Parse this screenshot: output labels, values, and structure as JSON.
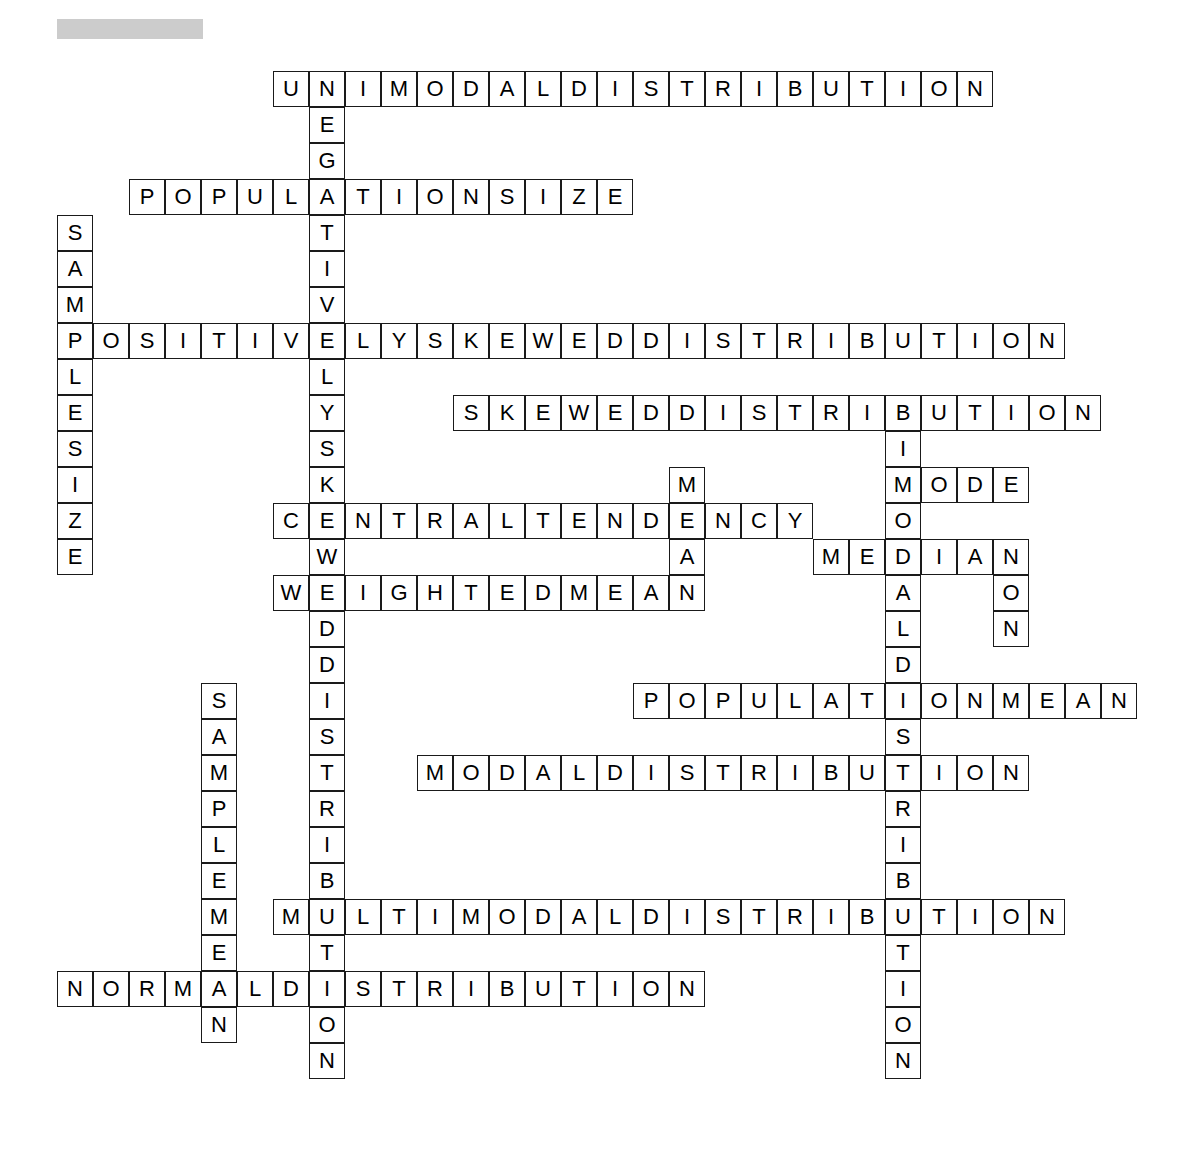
{
  "page": {
    "background_color": "#ffffff",
    "width": 1203,
    "height": 1167
  },
  "header": {
    "placeholder_label": "",
    "color": "#cccccc"
  },
  "grid": {
    "cell_size": 36,
    "origin_x": 57,
    "origin_y": 71,
    "border_color": "#1a1a1a",
    "cell_background": "#ffffff",
    "letter_color": "#000000"
  },
  "entries": [
    {
      "name": "unimodal-distribution",
      "answer": "UNIMODALDISTRIBUTION",
      "direction": "across",
      "row": 0,
      "col": 6,
      "length": 20
    },
    {
      "name": "negatively-skewed-distribution",
      "answer": "NEGATIVELYSKEWEDDISTRIBUTION",
      "direction": "down",
      "row": 0,
      "col": 7,
      "length": 28
    },
    {
      "name": "population-size",
      "answer": "POPULATIONSIZE",
      "direction": "across",
      "row": 3,
      "col": 2,
      "length": 14
    },
    {
      "name": "sample-size",
      "answer": "SAMPLESIZE",
      "direction": "down",
      "row": 4,
      "col": 0,
      "length": 10
    },
    {
      "name": "positively-skewed-distribution",
      "answer": "POSITIVELYSKEWEDDISTRIBUTION",
      "direction": "across",
      "row": 7,
      "col": 0,
      "length": 28
    },
    {
      "name": "skewed-distribution",
      "answer": "SKEWEDDISTRIBUTION",
      "direction": "across",
      "row": 9,
      "col": 11,
      "length": 18
    },
    {
      "name": "bimodal-distribution",
      "answer": "BIMODALDISTRIBUTION",
      "direction": "down",
      "row": 9,
      "col": 23,
      "length": 19
    },
    {
      "name": "mode",
      "answer": "MODE",
      "direction": "across",
      "row": 11,
      "col": 23,
      "length": 4
    },
    {
      "name": "mean-down",
      "answer": "MEAN",
      "direction": "down",
      "row": 11,
      "col": 17,
      "length": 4
    },
    {
      "name": "central-tendency",
      "answer": "CENTRALTENDENCY",
      "direction": "across",
      "row": 12,
      "col": 6,
      "length": 15
    },
    {
      "name": "median",
      "answer": "MEDIAN",
      "direction": "across",
      "row": 13,
      "col": 21,
      "length": 6
    },
    {
      "name": "non-down",
      "answer": "NON",
      "direction": "down",
      "row": 13,
      "col": 26,
      "length": 3
    },
    {
      "name": "weighted-mean",
      "answer": "WEIGHTEDMEAN",
      "direction": "across",
      "row": 14,
      "col": 6,
      "length": 12
    },
    {
      "name": "sample-mean",
      "answer": "SAMPLEMEAN",
      "direction": "down",
      "row": 17,
      "col": 4,
      "length": 10
    },
    {
      "name": "population-mean",
      "answer": "POPULATIONMEAN",
      "direction": "across",
      "row": 17,
      "col": 16,
      "length": 14
    },
    {
      "name": "modal-distribution",
      "answer": "MODALDISTRIBUTION",
      "direction": "across",
      "row": 19,
      "col": 10,
      "length": 17
    },
    {
      "name": "multimodal-distribution",
      "answer": "MULTIMODALDISTRIBUTION",
      "direction": "across",
      "row": 23,
      "col": 6,
      "length": 22
    },
    {
      "name": "normal-distribution",
      "answer": "NORMALDISTRIBUTION",
      "direction": "across",
      "row": 25,
      "col": 0,
      "length": 18
    }
  ]
}
